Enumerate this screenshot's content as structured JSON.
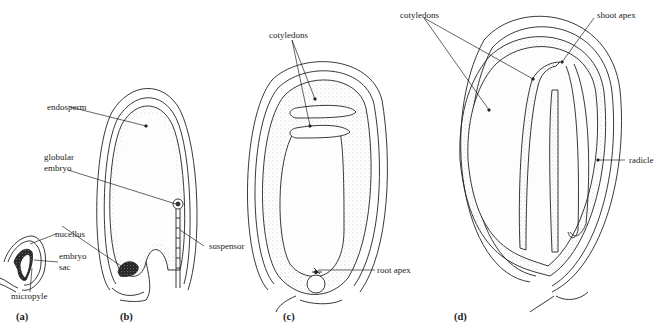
{
  "diagram": {
    "panels": [
      {
        "id": "a",
        "label": "(a)",
        "annotations": [
          "nucellus",
          "embryo sac",
          "micropyle"
        ]
      },
      {
        "id": "b",
        "label": "(b)",
        "annotations": [
          "endosperm",
          "globular embryo",
          "suspensor"
        ]
      },
      {
        "id": "c",
        "label": "(c)",
        "annotations": [
          "cotyledons",
          "root apex"
        ]
      },
      {
        "id": "d",
        "label": "(d)",
        "annotations": [
          "cotyledons",
          "shoot apex",
          "radicle"
        ]
      }
    ]
  },
  "labels": {
    "a_nucellus": "nucellus",
    "a_embryo": "embryo",
    "a_sac": "sac",
    "a_micropyle": "micropyle",
    "b_endosperm": "endosperm",
    "b_globular": "globular",
    "b_embryo": "embryo",
    "b_suspensor": "suspensor",
    "c_cotyledons": "cotyledons",
    "c_root_apex": "root apex",
    "d_cotyledons": "cotyledons",
    "d_shoot_apex": "shoot apex",
    "d_radicle": "radicle"
  },
  "panel_labels": {
    "a": "(a)",
    "b": "(b)",
    "c": "(c)",
    "d": "(d)"
  },
  "colors": {
    "line": "#222222",
    "stipple": "#9a9a9a",
    "nucellus_fill": "#2a2a2a",
    "background": "#ffffff"
  }
}
